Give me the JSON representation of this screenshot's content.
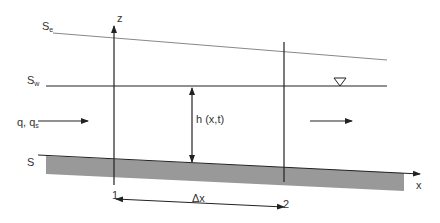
{
  "labels": {
    "se": "S",
    "se_sub": "e",
    "sw": "S",
    "sw_sub": "w",
    "s": "S",
    "z": "z",
    "x": "x",
    "h": "h (x,t)",
    "q": "q, q",
    "q_sub": "s",
    "section1": "1",
    "section2": "2",
    "dx": "Δx",
    "water_surface_symbol": "∇"
  },
  "colors": {
    "line": "#222222",
    "energy_line": "#888888",
    "bed_fill": "#999999",
    "background": "#ffffff"
  }
}
